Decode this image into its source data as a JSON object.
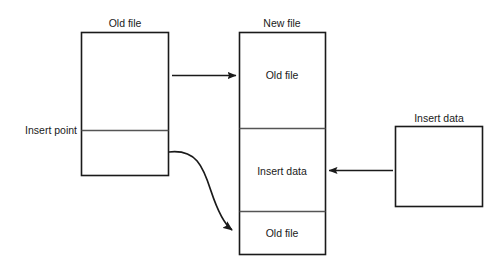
{
  "diagram": {
    "title_old_file": "Old file",
    "title_new_file": "New file",
    "title_insert_data": "Insert data",
    "insert_point_label": "Insert point",
    "new_file_segment_top": "Old file",
    "new_file_segment_middle": "Insert data",
    "new_file_segment_bottom": "Old file",
    "colors": {
      "stroke": "#1a1a1a",
      "divider": "#555555",
      "background": "#ffffff",
      "text": "#1a1a1a"
    },
    "arrows": {
      "straight_top": "arrow-old-file-to-new-file",
      "curved_bottom": "curved-arrow-old-file-tail-to-new-file",
      "straight_right": "arrow-insert-data-to-new-file"
    }
  }
}
